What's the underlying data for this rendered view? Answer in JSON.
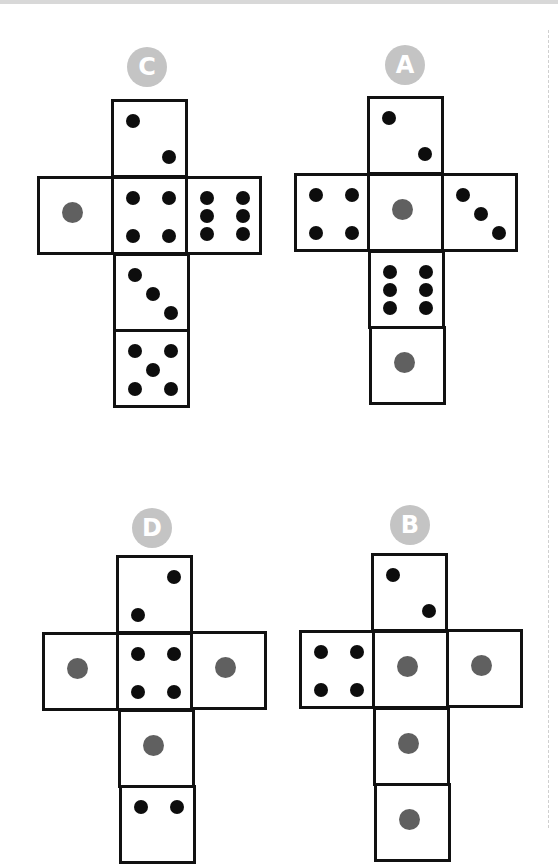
{
  "colors": {
    "badge": "#c4c4c4",
    "border": "#111111",
    "pip_black": "#0d0d0d",
    "pip_gray": "#606060"
  },
  "nets": [
    {
      "label": "C",
      "badge": {
        "x": 127,
        "y": 47
      },
      "faces": [
        {
          "name": "top",
          "x": 111,
          "y": 99,
          "value": 2,
          "pips": [
            {
              "x": 12,
              "y": 12,
              "c": "black"
            },
            {
              "x": 48,
              "y": 48,
              "c": "black"
            }
          ]
        },
        {
          "name": "left",
          "x": 37,
          "y": 176,
          "value": 1,
          "pips": [
            {
              "x": 25,
              "y": 26,
              "c": "gray"
            }
          ]
        },
        {
          "name": "center",
          "x": 111,
          "y": 176,
          "value": 4,
          "pips": [
            {
              "x": 12,
              "y": 12,
              "c": "black"
            },
            {
              "x": 48,
              "y": 12,
              "c": "black"
            },
            {
              "x": 12,
              "y": 50,
              "c": "black"
            },
            {
              "x": 48,
              "y": 50,
              "c": "black"
            }
          ]
        },
        {
          "name": "right",
          "x": 185,
          "y": 176,
          "value": 6,
          "pips": [
            {
              "x": 12,
              "y": 12,
              "c": "black"
            },
            {
              "x": 48,
              "y": 12,
              "c": "black"
            },
            {
              "x": 12,
              "y": 30,
              "c": "black"
            },
            {
              "x": 48,
              "y": 30,
              "c": "black"
            },
            {
              "x": 12,
              "y": 48,
              "c": "black"
            },
            {
              "x": 48,
              "y": 48,
              "c": "black"
            }
          ]
        },
        {
          "name": "lower",
          "x": 113,
          "y": 253,
          "value": 3,
          "pips": [
            {
              "x": 12,
              "y": 12,
              "c": "black"
            },
            {
              "x": 30,
              "y": 31,
              "c": "black"
            },
            {
              "x": 48,
              "y": 50,
              "c": "black"
            }
          ]
        },
        {
          "name": "bottom",
          "x": 113,
          "y": 329,
          "value": 5,
          "pips": [
            {
              "x": 12,
              "y": 12,
              "c": "black"
            },
            {
              "x": 48,
              "y": 12,
              "c": "black"
            },
            {
              "x": 30,
              "y": 31,
              "c": "black"
            },
            {
              "x": 12,
              "y": 50,
              "c": "black"
            },
            {
              "x": 48,
              "y": 50,
              "c": "black"
            }
          ]
        }
      ]
    },
    {
      "label": "A",
      "badge": {
        "x": 385,
        "y": 45
      },
      "faces": [
        {
          "name": "top",
          "x": 367,
          "y": 96,
          "value": 2,
          "pips": [
            {
              "x": 12,
              "y": 12,
              "c": "black"
            },
            {
              "x": 48,
              "y": 48,
              "c": "black"
            }
          ]
        },
        {
          "name": "left",
          "x": 294,
          "y": 173,
          "value": 4,
          "pips": [
            {
              "x": 12,
              "y": 12,
              "c": "black"
            },
            {
              "x": 48,
              "y": 12,
              "c": "black"
            },
            {
              "x": 12,
              "y": 50,
              "c": "black"
            },
            {
              "x": 48,
              "y": 50,
              "c": "black"
            }
          ]
        },
        {
          "name": "center",
          "x": 367,
          "y": 173,
          "value": 1,
          "pips": [
            {
              "x": 25,
              "y": 26,
              "c": "gray"
            }
          ]
        },
        {
          "name": "right",
          "x": 441,
          "y": 173,
          "value": 3,
          "pips": [
            {
              "x": 12,
              "y": 12,
              "c": "black"
            },
            {
              "x": 30,
              "y": 31,
              "c": "black"
            },
            {
              "x": 48,
              "y": 50,
              "c": "black"
            }
          ]
        },
        {
          "name": "lower",
          "x": 368,
          "y": 250,
          "value": 6,
          "pips": [
            {
              "x": 12,
              "y": 12,
              "c": "black"
            },
            {
              "x": 48,
              "y": 12,
              "c": "black"
            },
            {
              "x": 12,
              "y": 30,
              "c": "black"
            },
            {
              "x": 48,
              "y": 30,
              "c": "black"
            },
            {
              "x": 12,
              "y": 48,
              "c": "black"
            },
            {
              "x": 48,
              "y": 48,
              "c": "black"
            }
          ]
        },
        {
          "name": "bottom",
          "x": 369,
          "y": 326,
          "value": 1,
          "pips": [
            {
              "x": 25,
              "y": 26,
              "c": "gray"
            }
          ]
        }
      ]
    },
    {
      "label": "D",
      "badge": {
        "x": 132,
        "y": 508
      },
      "faces": [
        {
          "name": "top",
          "x": 116,
          "y": 555,
          "value": 2,
          "pips": [
            {
              "x": 48,
              "y": 12,
              "c": "black"
            },
            {
              "x": 12,
              "y": 50,
              "c": "black"
            }
          ]
        },
        {
          "name": "left",
          "x": 42,
          "y": 632,
          "value": 1,
          "pips": [
            {
              "x": 25,
              "y": 26,
              "c": "gray"
            }
          ]
        },
        {
          "name": "center",
          "x": 116,
          "y": 632,
          "value": 4,
          "pips": [
            {
              "x": 12,
              "y": 12,
              "c": "black"
            },
            {
              "x": 48,
              "y": 12,
              "c": "black"
            },
            {
              "x": 12,
              "y": 50,
              "c": "black"
            },
            {
              "x": 48,
              "y": 50,
              "c": "black"
            }
          ]
        },
        {
          "name": "right",
          "x": 190,
          "y": 631,
          "value": 1,
          "pips": [
            {
              "x": 25,
              "y": 26,
              "c": "gray"
            }
          ]
        },
        {
          "name": "lower",
          "x": 118,
          "y": 709,
          "value": 1,
          "pips": [
            {
              "x": 25,
              "y": 26,
              "c": "gray"
            }
          ]
        },
        {
          "name": "bottom",
          "x": 119,
          "y": 785,
          "value": 2,
          "pips": [
            {
              "x": 12,
              "y": 12,
              "c": "black"
            },
            {
              "x": 48,
              "y": 12,
              "c": "black"
            }
          ]
        }
      ]
    },
    {
      "label": "B",
      "badge": {
        "x": 390,
        "y": 505
      },
      "faces": [
        {
          "name": "top",
          "x": 371,
          "y": 553,
          "value": 2,
          "pips": [
            {
              "x": 12,
              "y": 12,
              "c": "black"
            },
            {
              "x": 48,
              "y": 48,
              "c": "black"
            }
          ]
        },
        {
          "name": "left",
          "x": 299,
          "y": 630,
          "value": 4,
          "pips": [
            {
              "x": 12,
              "y": 12,
              "c": "black"
            },
            {
              "x": 48,
              "y": 12,
              "c": "black"
            },
            {
              "x": 12,
              "y": 50,
              "c": "black"
            },
            {
              "x": 48,
              "y": 50,
              "c": "black"
            }
          ]
        },
        {
          "name": "center",
          "x": 372,
          "y": 630,
          "value": 1,
          "pips": [
            {
              "x": 25,
              "y": 26,
              "c": "gray"
            }
          ]
        },
        {
          "name": "right",
          "x": 446,
          "y": 629,
          "value": 1,
          "pips": [
            {
              "x": 25,
              "y": 26,
              "c": "gray"
            }
          ]
        },
        {
          "name": "lower",
          "x": 373,
          "y": 707,
          "value": 1,
          "pips": [
            {
              "x": 25,
              "y": 26,
              "c": "gray"
            }
          ]
        },
        {
          "name": "bottom",
          "x": 374,
          "y": 783,
          "value": 1,
          "pips": [
            {
              "x": 25,
              "y": 26,
              "c": "gray"
            }
          ]
        }
      ]
    }
  ]
}
